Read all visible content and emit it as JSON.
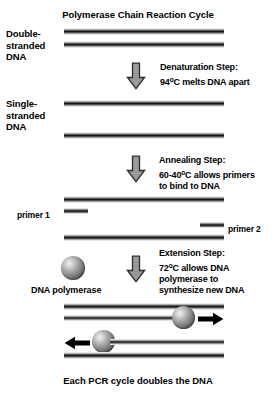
{
  "title": "Polymerase Chain Reaction Cycle",
  "caption": "Each PCR cycle doubles the DNA",
  "labels": {
    "double_stranded_line1": "Double-",
    "double_stranded_line2": "stranded",
    "double_stranded_line3": "DNA",
    "single_stranded_line1": "Single-",
    "single_stranded_line2": "stranded",
    "single_stranded_line3": "DNA",
    "primer_1": "primer 1",
    "primer_2": "primer 2",
    "dna_polymerase": "DNA polymerase"
  },
  "steps": [
    {
      "name": "denaturation",
      "line1": "Denaturation Step:",
      "line2_pre": "94",
      "line2_deg": "o",
      "line2_post": "C melts DNA apart"
    },
    {
      "name": "annealing",
      "line1": "Annealing Step:",
      "line2_pre": "60-40",
      "line2_deg": "o",
      "line2_post": "C allows primers",
      "line3": "to bind to DNA"
    },
    {
      "name": "extension",
      "line1": "Extension Step:",
      "line2_pre": "72",
      "line2_deg": "o",
      "line2_post": "C allows DNA",
      "line3": "polymerase to",
      "line4": "synthesize new DNA"
    }
  ],
  "icons": {
    "down_arrow": "down-arrow-icon",
    "right_arrow": "right-arrow-icon",
    "left_arrow": "left-arrow-icon",
    "sphere": "polymerase-sphere-icon"
  },
  "colors": {
    "background": "#ffffff",
    "text": "#000000",
    "arrow_fill": "#9a9a9a",
    "arrow_stroke": "#2b2b2b",
    "strand_core": "#111111",
    "sphere_light": "#f2f2f2",
    "sphere_dark": "#2b2b2b"
  }
}
